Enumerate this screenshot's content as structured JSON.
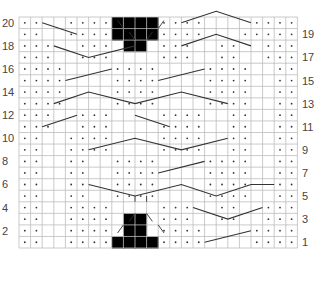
{
  "chart": {
    "cols": 24,
    "rows": 20,
    "grid": {
      "left": 19,
      "top": 17,
      "cell_w": 11.6,
      "cell_h": 11.55
    },
    "colors": {
      "grid": "#bdbdbd",
      "dot": "#333333",
      "line": "#333333",
      "block": "#000000",
      "label": "#444444"
    },
    "left_labels": [
      "20",
      "18",
      "16",
      "14",
      "12",
      "10",
      "8",
      "6",
      "4",
      "2"
    ],
    "right_labels": [
      "19",
      "17",
      "15",
      "13",
      "11",
      "9",
      "7",
      "5",
      "3",
      "1"
    ],
    "legend": {
      "dot": "purl",
      "empty": "knit",
      "black": "no stitch",
      "diagonal-line": "cable cross"
    },
    "dot_rows": {
      "20": [
        1,
        2,
        5,
        6,
        7,
        8,
        13,
        14,
        15,
        16,
        21,
        22,
        23,
        24
      ],
      "19": [
        1,
        2,
        5,
        6,
        7,
        8,
        13,
        14,
        15,
        16,
        20,
        21,
        22,
        23,
        24
      ],
      "18": [
        1,
        2,
        3,
        6,
        7,
        8,
        13,
        14,
        15,
        18,
        19,
        22,
        23,
        24
      ],
      "17": [
        1,
        2,
        3,
        6,
        7,
        8,
        13,
        14,
        15,
        18,
        19,
        22,
        23,
        24
      ],
      "16": [
        1,
        2,
        3,
        4,
        9,
        10,
        11,
        12,
        17,
        18,
        19,
        20,
        23,
        24
      ],
      "15": [
        1,
        2,
        3,
        4,
        9,
        10,
        11,
        12,
        17,
        18,
        19,
        20,
        23,
        24
      ],
      "14": [
        1,
        2,
        3,
        4,
        9,
        10,
        11,
        12,
        17,
        18,
        19,
        20,
        23,
        24
      ],
      "13": [
        1,
        2,
        3,
        4,
        9,
        10,
        11,
        12,
        17,
        18,
        19,
        20,
        23,
        24
      ],
      "12": [
        1,
        2,
        3,
        6,
        7,
        8,
        13,
        14,
        15,
        16,
        19,
        20,
        23,
        24
      ],
      "11": [
        1,
        2,
        3,
        6,
        7,
        8,
        13,
        14,
        15,
        16,
        19,
        20,
        23,
        24
      ],
      "10": [
        1,
        2,
        5,
        6,
        7,
        8,
        13,
        14,
        15,
        16,
        19,
        20,
        23,
        24
      ],
      "9": [
        1,
        2,
        5,
        6,
        7,
        8,
        13,
        14,
        15,
        16,
        19,
        20,
        23,
        24
      ],
      "8": [
        1,
        2,
        5,
        6,
        9,
        10,
        11,
        12,
        17,
        18,
        19,
        20,
        23,
        24
      ],
      "7": [
        1,
        2,
        5,
        6,
        9,
        10,
        11,
        12,
        17,
        18,
        19,
        20,
        23,
        24
      ],
      "6": [
        1,
        2,
        5,
        6,
        9,
        10,
        11,
        12,
        17,
        18,
        19,
        20,
        23,
        24
      ],
      "5": [
        1,
        2,
        5,
        6,
        9,
        10,
        11,
        12,
        17,
        18,
        19,
        20,
        23,
        24
      ],
      "4": [
        1,
        2,
        5,
        6,
        7,
        8,
        13,
        14,
        15,
        18,
        19,
        22,
        23,
        24
      ],
      "3": [
        1,
        2,
        5,
        6,
        7,
        8,
        13,
        14,
        15,
        18,
        19,
        22,
        23,
        24
      ],
      "2": [
        1,
        2,
        5,
        6,
        7,
        8,
        13,
        14,
        15,
        16,
        21,
        22,
        23,
        24
      ],
      "1": [
        1,
        2,
        5,
        6,
        7,
        8,
        13,
        14,
        15,
        16,
        21,
        22,
        23,
        24
      ]
    },
    "black_cells": {
      "20": [
        9,
        10,
        11,
        12
      ],
      "19": [
        9,
        10,
        11,
        12
      ],
      "18": [
        10,
        11
      ],
      "3": [
        10,
        11
      ],
      "2": [
        10,
        11
      ],
      "1": [
        9,
        10,
        11,
        12
      ]
    },
    "cable_lines": [
      [
        [
          2,
          19.5
        ],
        [
          5,
          18.5
        ]
      ],
      [
        [
          3,
          17.5
        ],
        [
          6,
          16.5
        ],
        [
          10,
          17.5
        ]
      ],
      [
        [
          14,
          17.5
        ],
        [
          17,
          18.5
        ],
        [
          20,
          17.5
        ]
      ],
      [
        [
          14,
          19.5
        ],
        [
          17,
          20.5
        ],
        [
          20,
          19.5
        ]
      ],
      [
        [
          4,
          14.5
        ],
        [
          8,
          15.5
        ]
      ],
      [
        [
          12,
          14.5
        ],
        [
          16,
          15.5
        ]
      ],
      [
        [
          3,
          12.5
        ],
        [
          6,
          13.5
        ],
        [
          10,
          12.5
        ],
        [
          14,
          13.5
        ],
        [
          18,
          12.5
        ]
      ],
      [
        [
          2,
          10.5
        ],
        [
          5,
          11.5
        ]
      ],
      [
        [
          10,
          11.5
        ],
        [
          13,
          10.5
        ]
      ],
      [
        [
          6,
          8.5
        ],
        [
          10,
          9.5
        ],
        [
          14,
          8.5
        ],
        [
          18,
          9.5
        ]
      ],
      [
        [
          12,
          6.5
        ],
        [
          16,
          7.5
        ]
      ],
      [
        [
          6,
          5.5
        ],
        [
          10,
          4.5
        ],
        [
          14,
          5.5
        ],
        [
          17,
          4.5
        ],
        [
          20,
          5.5
        ],
        [
          22,
          5.5
        ]
      ],
      [
        [
          15,
          3.5
        ],
        [
          18,
          2.5
        ],
        [
          21,
          3.5
        ]
      ],
      [
        [
          16,
          0.5
        ],
        [
          20,
          1.5
        ]
      ]
    ],
    "ticks": [
      [
        [
          8.5,
          19.7
        ],
        [
          9,
          19
        ]
      ],
      [
        [
          12.5,
          19.7
        ],
        [
          12,
          19
        ]
      ],
      [
        [
          9.5,
          18.7
        ],
        [
          10,
          18
        ]
      ],
      [
        [
          11.5,
          18.7
        ],
        [
          11,
          18
        ]
      ],
      [
        [
          9.5,
          2.3
        ],
        [
          10,
          3
        ]
      ],
      [
        [
          11.5,
          2.3
        ],
        [
          11,
          3
        ]
      ],
      [
        [
          8.5,
          1.3
        ],
        [
          9,
          2
        ]
      ],
      [
        [
          12.5,
          1.3
        ],
        [
          12,
          2
        ]
      ],
      [
        [
          10,
          4.5
        ],
        [
          10,
          4
        ]
      ],
      [
        [
          11,
          4.5
        ],
        [
          11,
          4
        ]
      ]
    ]
  }
}
